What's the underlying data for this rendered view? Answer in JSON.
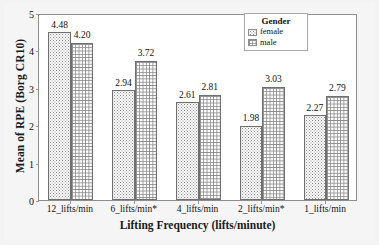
{
  "chart_data": {
    "type": "bar",
    "title": "",
    "xlabel": "Lifting Frequency (lifts/minute)",
    "ylabel": "Mean of RPE (Borg CR10)",
    "categories": [
      "12_lifts/min",
      "6_lifts/min*",
      "4_lifts/min",
      "2_lifts/min*",
      "1_lifts/min"
    ],
    "series": [
      {
        "name": "female",
        "values": [
          4.48,
          2.94,
          2.61,
          1.98,
          2.27
        ]
      },
      {
        "name": "male",
        "values": [
          4.2,
          3.72,
          2.81,
          3.03,
          2.79
        ]
      }
    ],
    "ylim": [
      0,
      5
    ],
    "yticks": [
      "0",
      "1",
      "2",
      "3",
      "4",
      "5"
    ],
    "grid": false,
    "legend": {
      "title": "Gender",
      "position": "top-right",
      "entries": [
        "female",
        "male"
      ]
    },
    "data_labels": {
      "female": [
        "4.48",
        "2.94",
        "2.61",
        "1.98",
        "2.27"
      ],
      "male": [
        "4.20",
        "3.72",
        "2.81",
        "3.03",
        "2.79"
      ]
    }
  },
  "axes": {
    "y_title": "Mean of RPE (Borg CR10)",
    "x_title": "Lifting Frequency (lifts/minute)",
    "y_tick_labels": [
      "5",
      "4",
      "3",
      "2",
      "1",
      "0"
    ],
    "x_tick_labels": [
      "12_lifts/min",
      "6_lifts/min*",
      "4_lifts/min",
      "2_lifts/min*",
      "1_lifts/min"
    ]
  },
  "legend": {
    "title": "Gender",
    "items": [
      {
        "label": "female",
        "pattern": "dotted-fill-swatch"
      },
      {
        "label": "male",
        "pattern": "crosshatch-fill-swatch"
      }
    ]
  },
  "colors": {
    "panel_background": "#ffffff",
    "figure_background": "#f5f5f5",
    "axis_line": "#8d8d8d",
    "bar_outline": "#6f6f6f",
    "pattern_ink": "#8a8a8a",
    "text": "#111111"
  }
}
